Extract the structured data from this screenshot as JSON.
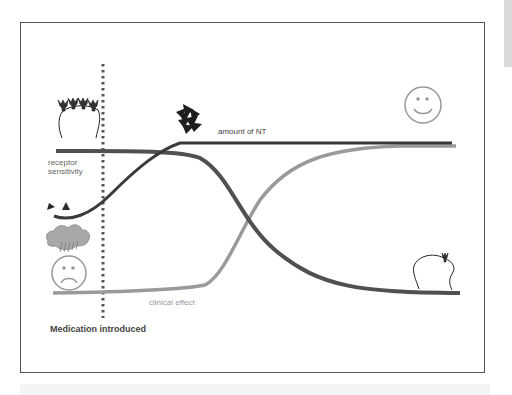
{
  "diagram": {
    "labels": {
      "amount_of_nt": "amount of NT",
      "receptor_sensitivity_line1": "receptor",
      "receptor_sensitivity_line2": "sensitivity",
      "clinical_effect": "clinical effect",
      "medication_introduced": "Medication introduced"
    },
    "curves": [
      {
        "name": "amount of NT",
        "trend": "low then rises sharply after medication, plateaus high",
        "color": "#3a3a3a"
      },
      {
        "name": "receptor sensitivity",
        "trend": "high then declines sigmoidally to low",
        "color": "#505050"
      },
      {
        "name": "clinical effect",
        "trend": "low, delayed sigmoidal rise to high",
        "color": "#9a9a9a"
      }
    ],
    "icons": {
      "many_receptors": "receptor-cluster-icon",
      "few_nt": "neurotransmitter-pair-icon",
      "rain_cloud": "rain-cloud-icon",
      "sad_face": "sad-face-icon",
      "nt_cluster": "neurotransmitter-cluster-icon",
      "happy_face": "happy-face-icon",
      "single_receptor": "single-receptor-icon"
    },
    "colors": {
      "frame": "#555555",
      "nt_line": "#3a3a3a",
      "receptor_line": "#505050",
      "clinical_line": "#9a9a9a",
      "dotted_marker": "#555555"
    }
  }
}
